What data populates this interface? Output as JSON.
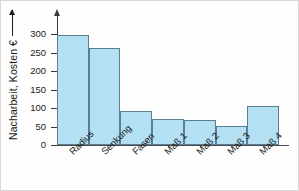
{
  "chart_data": {
    "type": "bar",
    "title": "",
    "subtitle": "",
    "xlabel": "",
    "ylabel": "Nacharbeit, Kosten €",
    "ylim": [
      0,
      320
    ],
    "yticks": [
      0,
      50,
      100,
      150,
      200,
      250,
      300
    ],
    "ytick_labels": [
      "0",
      "50",
      "100",
      "150",
      "200",
      "250",
      "300"
    ],
    "grid": false,
    "legend": null,
    "categories": [
      "Radius",
      "Senkung",
      "Fasen",
      "Maß 1",
      "Maß 2",
      "Maß 3",
      "Maß 4"
    ],
    "values": [
      299,
      262,
      92,
      71,
      68,
      51,
      106
    ],
    "bar_fill_color": "#b3e0f2",
    "bar_edge_color": "#5c7f91",
    "axis_color": "#3a3a3a",
    "text_color": "#1b1b1b",
    "background_color": "#fefefe",
    "y_axis_has_arrow": true,
    "x_tick_label_rotation_deg": -45
  },
  "axis": {
    "y_title": "Nacharbeit, Kosten €"
  }
}
